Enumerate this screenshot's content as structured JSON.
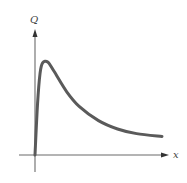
{
  "chart_data": {
    "type": "line",
    "title": "",
    "xlabel": "x",
    "ylabel": "Q",
    "grid": false,
    "legend": null,
    "axis_ticks": "none",
    "series": [
      {
        "name": "Q(x)",
        "points_normalized": [
          [
            0.0,
            0.0
          ],
          [
            0.02,
            0.55
          ],
          [
            0.04,
            0.88
          ],
          [
            0.06,
            0.99
          ],
          [
            0.1,
            1.0
          ],
          [
            0.15,
            0.9
          ],
          [
            0.25,
            0.68
          ],
          [
            0.35,
            0.52
          ],
          [
            0.5,
            0.37
          ],
          [
            0.65,
            0.28
          ],
          [
            0.8,
            0.23
          ],
          [
            1.0,
            0.2
          ]
        ]
      }
    ],
    "xlim": [
      0,
      1
    ],
    "ylim": [
      0,
      1.2
    ]
  },
  "labels": {
    "y_axis": "Q",
    "x_axis": "x"
  },
  "colors": {
    "curve": "#5a5a5a",
    "axis": "#6b6b6b"
  }
}
